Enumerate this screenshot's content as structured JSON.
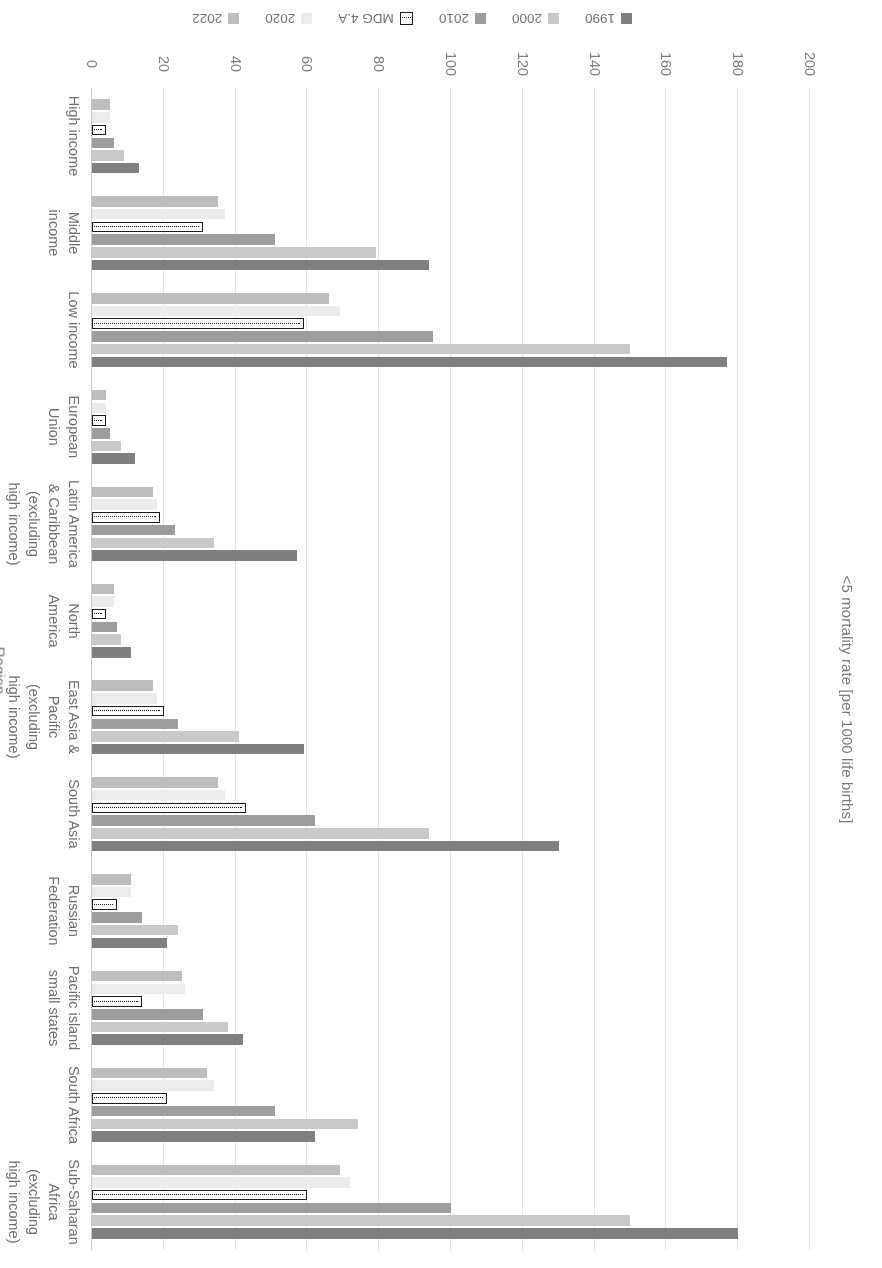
{
  "chart_data": {
    "type": "bar",
    "orientation": "horizontal",
    "title": "",
    "xlabel": "Region",
    "ylabel": "<5 mortality rate [per 1000 life births]",
    "ylim": [
      0,
      200
    ],
    "yticks": [
      0,
      20,
      40,
      60,
      80,
      100,
      120,
      140,
      160,
      180,
      200
    ],
    "grid": true,
    "legend_position": "bottom",
    "rotation_degrees": 180,
    "categories": [
      "Sub-Saharan Africa (excluding high income)",
      "South Africa",
      "Pacific island small states",
      "Russian Federation",
      "South Asia",
      "East Asia & Pacific (excluding high income)",
      "North America",
      "Latin America & Caribbean (excluding high income)",
      "European Union",
      "Low income",
      "Middle income",
      "High income"
    ],
    "category_labels": [
      "Sub-Saharan\nAfrica\n(excluding\nhigh income)",
      "South Africa",
      "Pacific island\nsmall states",
      "Russian\nFederation",
      "South Asia",
      "East Asia &\nPacific\n(excluding\nhigh income)",
      "North\nAmerica",
      "Latin America\n& Caribbean\n(excluding\nhigh income)",
      "European\nUnion",
      "Low income",
      "Middle\nincome",
      "High income"
    ],
    "series": [
      {
        "name": "1990",
        "color": "#7f7f7f",
        "values": [
          180,
          62,
          42,
          21,
          130,
          59,
          11,
          57,
          12,
          177,
          94,
          13
        ]
      },
      {
        "name": "2000",
        "color": "#c9c9c9",
        "values": [
          150,
          74,
          38,
          24,
          94,
          41,
          8,
          34,
          8,
          150,
          79,
          9
        ]
      },
      {
        "name": "2010",
        "color": "#9d9d9d",
        "values": [
          100,
          51,
          31,
          14,
          62,
          24,
          7,
          23,
          5,
          95,
          51,
          6
        ]
      },
      {
        "name": "MDG 4.A",
        "color": "#ffffff",
        "values": [
          60,
          21,
          14,
          7,
          43,
          20,
          4,
          19,
          4,
          59,
          31,
          4
        ],
        "style": "outline-dotted"
      },
      {
        "name": "2020",
        "color": "#ebebeb",
        "values": [
          72,
          34,
          26,
          11,
          37,
          18,
          6,
          18,
          4,
          69,
          37,
          5
        ]
      },
      {
        "name": "2022",
        "color": "#bdbdbd",
        "values": [
          69,
          32,
          25,
          11,
          35,
          17,
          6,
          17,
          4,
          66,
          35,
          5
        ]
      }
    ]
  },
  "legend": {
    "items": [
      {
        "label": "1990",
        "color": "#7f7f7f",
        "style": "fill"
      },
      {
        "label": "2000",
        "color": "#c9c9c9",
        "style": "fill"
      },
      {
        "label": "2010",
        "color": "#9d9d9d",
        "style": "fill"
      },
      {
        "label": "MDG 4.A",
        "color": "#ffffff",
        "style": "outline-dotted"
      },
      {
        "label": "2020",
        "color": "#ebebeb",
        "style": "fill"
      },
      {
        "label": "2022",
        "color": "#bdbdbd",
        "style": "fill"
      }
    ]
  },
  "axes": {
    "value_axis_title": "<5 mortality rate [per 1000 life births]",
    "category_axis_title": "Region",
    "value_ticks": [
      "200",
      "180",
      "160",
      "140",
      "120",
      "100",
      "80",
      "60",
      "40",
      "20",
      "0"
    ]
  }
}
